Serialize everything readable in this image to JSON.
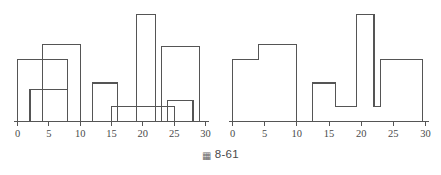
{
  "figure": {
    "caption_mark": "▦",
    "caption_text": "8-61",
    "line_color": "#555555",
    "background_color": "#ffffff"
  },
  "chart_data": [
    {
      "id": "left",
      "type": "bar",
      "title": "",
      "xlabel": "",
      "ylabel": "",
      "grid": false,
      "legend": false,
      "xlim": [
        0,
        30
      ],
      "ylim": [
        0,
        100
      ],
      "xticks": [
        0,
        5,
        10,
        15,
        20,
        25,
        30
      ],
      "xtick_labels": [
        "0",
        "5",
        "10",
        "15",
        "20",
        "25",
        "30"
      ],
      "note": "Overlapping unfilled rectangle outlines with unequal bin widths",
      "bins": [
        {
          "x0": 0,
          "x1": 8,
          "height": 58
        },
        {
          "x0": 2,
          "x1": 8,
          "height": 30
        },
        {
          "x0": 4,
          "x1": 10,
          "height": 72
        },
        {
          "x0": 12,
          "x1": 16,
          "height": 36
        },
        {
          "x0": 15,
          "x1": 25,
          "height": 14
        },
        {
          "x0": 19,
          "x1": 22,
          "height": 100
        },
        {
          "x0": 23,
          "x1": 29,
          "height": 70
        },
        {
          "x0": 24,
          "x1": 28,
          "height": 20
        }
      ]
    },
    {
      "id": "right",
      "type": "bar",
      "title": "",
      "xlabel": "",
      "ylabel": "",
      "grid": false,
      "legend": false,
      "xlim": [
        0,
        30
      ],
      "ylim": [
        0,
        100
      ],
      "xticks": [
        0,
        5,
        10,
        15,
        20,
        25,
        30
      ],
      "xtick_labels": [
        "0",
        "5",
        "10",
        "15",
        "20",
        "25",
        "30"
      ],
      "note": "Contiguous step histogram, zero between 10 and 12.5",
      "bins": [
        {
          "x0": 0,
          "x1": 4,
          "height": 58
        },
        {
          "x0": 4,
          "x1": 10,
          "height": 72
        },
        {
          "x0": 10,
          "x1": 12.5,
          "height": 0
        },
        {
          "x0": 12.5,
          "x1": 16,
          "height": 36
        },
        {
          "x0": 16,
          "x1": 19.3,
          "height": 14
        },
        {
          "x0": 19.3,
          "x1": 22,
          "height": 100
        },
        {
          "x0": 22,
          "x1": 23,
          "height": 14
        },
        {
          "x0": 23,
          "x1": 29.5,
          "height": 58
        }
      ]
    }
  ]
}
